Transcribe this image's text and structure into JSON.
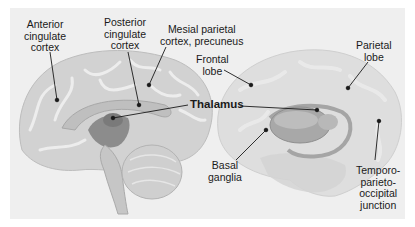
{
  "figure": {
    "type": "anatomical-brain-diagram",
    "panels": [
      {
        "id": "sagittal",
        "view": "midsagittal section (medial view)"
      },
      {
        "id": "lateral",
        "view": "lateral translucent view showing deep structures"
      }
    ]
  },
  "labels": {
    "anterior_cingulate": {
      "line1": "Anterior",
      "line2": "cingulate",
      "line3": "cortex"
    },
    "posterior_cingulate": {
      "line1": "Posterior",
      "line2": "cingulate",
      "line3": "cortex"
    },
    "mesial_parietal": {
      "line1": "Mesial parietal",
      "line2": "cortex, precuneus"
    },
    "frontal_lobe": {
      "line1": "Frontal",
      "line2": "lobe"
    },
    "parietal_lobe": {
      "line1": "Parietal",
      "line2": "lobe"
    },
    "thalamus": {
      "text": "Thalamus"
    },
    "basal_ganglia": {
      "line1": "Basal",
      "line2": "ganglia"
    },
    "tpo_junction": {
      "line1": "Temporo-",
      "line2": "parieto-",
      "line3": "occipital",
      "line4": "junction"
    }
  },
  "colors": {
    "background": "#ffffff",
    "panel": "#efefef",
    "cortex": "#d2d2d2",
    "gyri_highlight": "#e4e4e4",
    "deep_structures": "#8c8c8c",
    "leader_lines": "#1a1a1a"
  }
}
